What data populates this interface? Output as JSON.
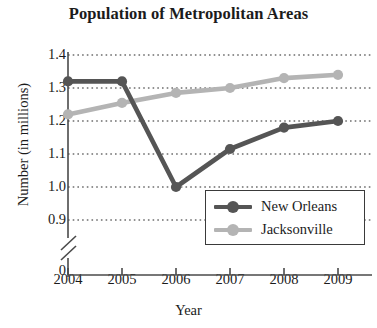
{
  "chart_data": {
    "type": "line",
    "title": "Population of Metropolitan Areas",
    "xlabel": "Year",
    "ylabel": "Number (in millions)",
    "categories": [
      "2004",
      "2005",
      "2006",
      "2007",
      "2008",
      "2009"
    ],
    "x": [
      2004,
      2005,
      2006,
      2007,
      2008,
      2009
    ],
    "ylim": [
      0.9,
      1.4
    ],
    "yticks": [
      "1.4",
      "1.3",
      "1.2",
      "1.1",
      "1.0",
      "0.9",
      "0"
    ],
    "ytick_values": [
      1.4,
      1.3,
      1.2,
      1.1,
      1.0,
      0.9
    ],
    "axis_break": true,
    "axis_break_label": "0",
    "grid": "horizontal-dotted",
    "legend_position": "lower-right",
    "series": [
      {
        "name": "New Orleans",
        "color": "#555555",
        "values": [
          1.32,
          1.32,
          1.0,
          1.115,
          1.18,
          1.2
        ]
      },
      {
        "name": "Jacksonville",
        "color": "#b4b4b4",
        "values": [
          1.22,
          1.255,
          1.285,
          1.3,
          1.33,
          1.34
        ]
      }
    ]
  },
  "legend": {
    "items": [
      {
        "label": "New Orleans"
      },
      {
        "label": "Jacksonville"
      }
    ]
  },
  "colors": {
    "new_orleans": "#555555",
    "jacksonville": "#b4b4b4",
    "axis": "#4a4a4a",
    "grid": "#6e6e6e",
    "text": "#1b1b1b"
  }
}
